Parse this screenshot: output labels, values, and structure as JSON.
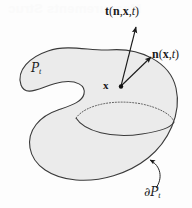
{
  "figure": {
    "name": "continuum-body-traction-diagram",
    "caption_ghost": "Measurements Struc",
    "background_color": "#fdfdfd",
    "body": {
      "name": "material-body-region",
      "fill_color": "#ebebeb",
      "stroke_color": "#3a3a3a",
      "label_plain": "Pt",
      "label_symbol": "P",
      "label_subscript": "t"
    },
    "boundary": {
      "name": "body-boundary",
      "label_symbol": "∂P",
      "label_subscript": "t",
      "label_plain": "∂Pt"
    },
    "cut_surface": {
      "name": "internal-cut-surface",
      "hidden_arc_style": "dotted",
      "visible_arc_style": "solid"
    },
    "point": {
      "name": "material-point-x",
      "label": "x",
      "x": 121,
      "y": 87
    },
    "vectors": [
      {
        "name": "traction-vector",
        "symbol": "t",
        "arguments": [
          "n",
          "x",
          "t"
        ],
        "label_plain": "t(n,x,t)",
        "from": [
          121,
          86
        ],
        "to": [
          137,
          26
        ]
      },
      {
        "name": "normal-vector",
        "symbol": "n",
        "arguments": [
          "x",
          "t"
        ],
        "label_plain": "n(x,t)",
        "from": [
          121,
          86
        ],
        "to": [
          152,
          56
        ]
      }
    ],
    "leader": {
      "name": "boundary-leader-line",
      "from": [
        152,
        190
      ],
      "to": [
        148,
        159
      ]
    }
  }
}
